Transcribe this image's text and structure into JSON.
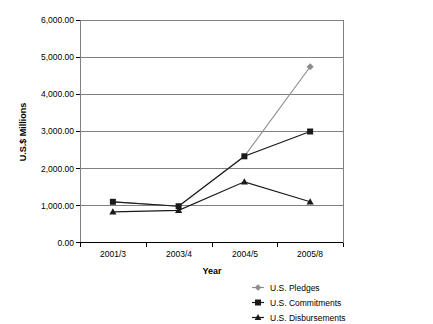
{
  "chart_data": {
    "type": "line",
    "title": "",
    "xlabel": "Year",
    "ylabel": "U.S.$ Millions",
    "categories": [
      "2001/3",
      "2003/4",
      "2004/5",
      "2005/8"
    ],
    "ylim": [
      0,
      6000
    ],
    "ytick_labels": [
      "6,000.00",
      "5,000.00",
      "4,000.00",
      "3,000.00",
      "2,000.00",
      "1,000.00",
      "0.00"
    ],
    "ytick_values": [
      6000,
      5000,
      4000,
      3000,
      2000,
      1000,
      0
    ],
    "grid": "horizontal",
    "legend_position": "bottom-right-outside",
    "series": [
      {
        "name": "U.S. Pledges",
        "marker": "diamond",
        "color": "#8c8c8c",
        "values": [
          1100,
          980,
          2330,
          4750
        ]
      },
      {
        "name": "U.S. Commitments",
        "marker": "square",
        "color": "#1a1a1a",
        "values": [
          1100,
          980,
          2330,
          3000
        ]
      },
      {
        "name": "U.S. Disbursements",
        "marker": "triangle",
        "color": "#1a1a1a",
        "values": [
          830,
          870,
          1640,
          1100
        ]
      }
    ]
  },
  "legend": {
    "items": [
      {
        "label": "U.S. Pledges"
      },
      {
        "label": "U.S. Commitments"
      },
      {
        "label": "U.S. Disbursements"
      }
    ]
  },
  "colors": {
    "axis": "#000000",
    "grid": "#808080",
    "pledges": "#8c8c8c",
    "commitments": "#1a1a1a",
    "disbursements": "#1a1a1a"
  }
}
